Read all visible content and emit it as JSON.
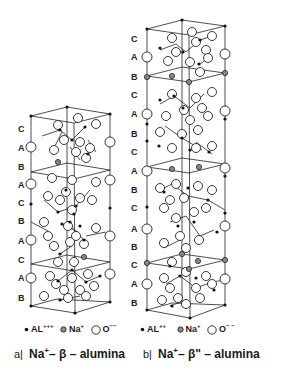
{
  "diagram": {
    "a": {
      "layers": [
        "C",
        "A",
        "B",
        "A",
        "C",
        "B",
        "A",
        "C",
        "A",
        "B"
      ],
      "layer_y": [
        129,
        148,
        167,
        185,
        203,
        221,
        241,
        260,
        278,
        298
      ],
      "legend": {
        "al": "AL",
        "al_charge": "+++",
        "na": "Na",
        "na_charge": "+",
        "o": "O",
        "o_charge": "−−"
      },
      "caption": {
        "prefix": "a|",
        "ion": "Na",
        "ion_charge": "+",
        "phase": "– β – alumina"
      }
    },
    "b": {
      "layers": [
        "C",
        "A",
        "B",
        "C",
        "A",
        "B",
        "C",
        "A",
        "B",
        "C",
        "A",
        "B",
        "C",
        "A",
        "B"
      ],
      "layer_y": [
        39,
        57,
        77,
        95,
        114,
        134,
        152,
        171,
        190,
        208,
        229,
        247,
        265,
        284,
        303
      ],
      "legend": {
        "al": "AL",
        "al_charge": "++",
        "na": "Na",
        "na_charge": "+",
        "o": "O",
        "o_charge": "− −"
      },
      "caption": {
        "prefix": "b|",
        "ion": "Na",
        "ion_charge": "+",
        "phase": "– β\" – alumina"
      }
    },
    "colors": {
      "line": "#222222",
      "na_fill": "#888888",
      "background": "#ffffff"
    }
  }
}
